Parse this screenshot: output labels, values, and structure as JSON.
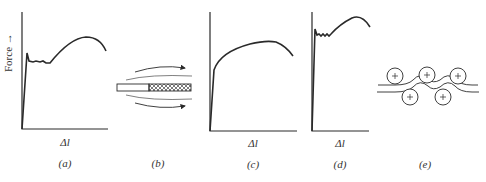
{
  "figure": {
    "y_axis_label": "Force →",
    "panels": [
      {
        "id": "a",
        "caption": "(a)",
        "x_label": "Δl",
        "description": "Force-elongation curve with sharp upper yield point, yield plateau (Lüders band), then work hardening and necking"
      },
      {
        "id": "b",
        "caption": "(b)",
        "description": "Lüders band propagation along a specimen; curved arrows indicate flow"
      },
      {
        "id": "c",
        "caption": "(c)",
        "x_label": "Δl",
        "description": "Smooth continuous yielding curve without yield point"
      },
      {
        "id": "d",
        "caption": "(d)",
        "x_label": "Δl",
        "description": "Curve with yield point and serrated short plateau"
      },
      {
        "id": "e",
        "caption": "(e)",
        "description": "Roller leveling: sheet passing between staggered rollers"
      }
    ]
  },
  "colors": {
    "line": "#2a2a2a",
    "text": "#333333"
  }
}
